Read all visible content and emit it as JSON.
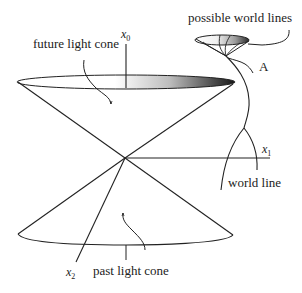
{
  "diagram": {
    "type": "light-cone",
    "labels": {
      "future_light_cone": "future light cone",
      "past_light_cone": "past light cone",
      "possible_world_lines": "possible world lines",
      "world_line": "world line",
      "point_a": "A",
      "axis_x0_base": "x",
      "axis_x0_sub": "0",
      "axis_x1_base": "x",
      "axis_x1_sub": "1",
      "axis_x2_base": "x",
      "axis_x2_sub": "2"
    },
    "colors": {
      "stroke": "#222222",
      "gradient_light": "#ffffff",
      "gradient_dark": "#1a1a1a"
    }
  }
}
